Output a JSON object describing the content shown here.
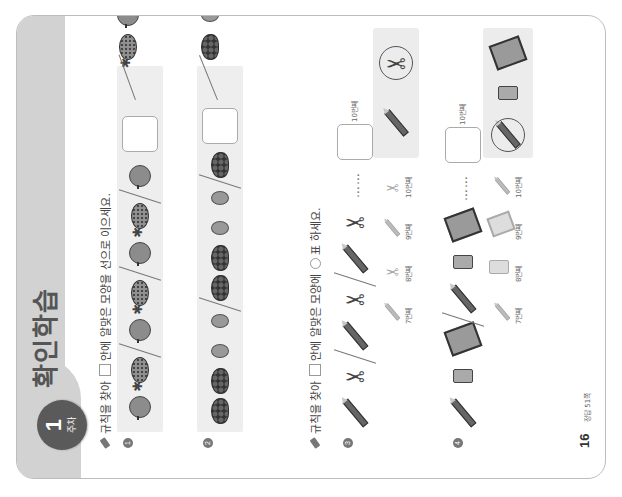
{
  "header": {
    "week_badge_number": "1",
    "week_badge_label": "주차",
    "title": "확인학습"
  },
  "section1": {
    "instruction_before_box": "규칙을 찾아",
    "instruction_after_box": "안에 알맞은 모양을 선으로 이으세요.",
    "problems": [
      {
        "number": "1",
        "sequence": [
          "apple",
          "pineapple",
          "apple",
          "pineapple",
          "apple",
          "pineapple",
          "apple",
          "blank"
        ],
        "choices": [
          "pineapple",
          "apple"
        ],
        "connected_to": "pineapple"
      },
      {
        "number": "2",
        "sequence": [
          "grapes",
          "grapes",
          "kiwi",
          "kiwi",
          "grapes",
          "grapes",
          "kiwi",
          "kiwi",
          "grapes",
          "blank"
        ],
        "choices": [
          "grapes",
          "kiwi"
        ],
        "connected_to": "grapes"
      }
    ]
  },
  "section2": {
    "instruction_before_box": "규칙을 찾아",
    "instruction_after_box": "안에 알맞은 모양에",
    "instruction_after_circle": "표 하세요.",
    "problems": [
      {
        "number": "3",
        "sequence": [
          "pencil",
          "scissors",
          "pencil",
          "scissors",
          "pencil",
          "scissors"
        ],
        "ellipsis": "……",
        "blank_label": "10번째",
        "hints": [
          {
            "shape": "pencil",
            "label": "7번째"
          },
          {
            "shape": "scissors",
            "label": "8번째"
          },
          {
            "shape": "pencil",
            "label": "9번째"
          },
          {
            "shape": "scissors",
            "label": "10번째"
          }
        ],
        "choices": [
          "pencil",
          "scissors"
        ],
        "circled": "scissors"
      },
      {
        "number": "4",
        "sequence": [
          "pencil",
          "eraser",
          "notebook",
          "pencil",
          "eraser",
          "notebook"
        ],
        "ellipsis": "……",
        "blank_label": "10번째",
        "hints": [
          {
            "shape": "pencil",
            "label": "7번째"
          },
          {
            "shape": "eraser",
            "label": "8번째"
          },
          {
            "shape": "notebook",
            "label": "9번째"
          },
          {
            "shape": "pencil",
            "label": "10번째"
          }
        ],
        "choices": [
          "pencil",
          "eraser",
          "notebook"
        ],
        "circled": "pencil"
      }
    ]
  },
  "footer": {
    "page_number": "16",
    "answer_ref": "정답 51쪽"
  },
  "colors": {
    "header_band": "#d2d2d2",
    "badge": "#5a5a5a",
    "panel": "#eeeeee"
  }
}
